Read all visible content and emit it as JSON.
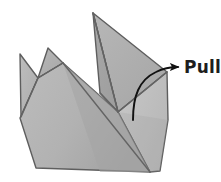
{
  "figure": {
    "name": "origami-pull-step-diagram",
    "type": "instructional-line-drawing",
    "background_color": "#ffffff"
  },
  "annotation": {
    "label": "Pull",
    "label_color": "#1d1d1d",
    "arrow_color": "#111111",
    "arrow_kind": "curved-arrow",
    "arrow_start": [
      133,
      120
    ],
    "arrow_end": [
      180,
      67
    ]
  },
  "palette": {
    "outline": "#5e5e5e",
    "fold_line": "#6b6b6b",
    "face_body_left": "#b9b9b9",
    "face_body_mid": "#a9a9a9",
    "face_body_right": "#c2c2c2",
    "face_flap_left": "#b4b4b4",
    "face_flap_mid": "#adadad",
    "face_spike_tall": "#a6a6a6",
    "face_spike_tall_right": "#b0b0b0",
    "face_shadow": "#9a9a9a"
  },
  "shapes": {
    "body_main": {
      "name": "body-main-face",
      "points": "20,118 37,78 62,63 118,112 150,172 36,168"
    },
    "body_right": {
      "name": "body-right-face",
      "points": "118,112 167,72 168,120 160,170 150,172"
    },
    "spike_left": {
      "name": "left-spike-flap",
      "points": "20,54 37,78 20,118"
    },
    "spike_mid": {
      "name": "middle-spike-flap",
      "points": "48,48 62,63 37,78"
    },
    "spike_tall": {
      "name": "tall-spike-flap",
      "points": "93,13 118,112 101,94"
    },
    "spike_tall_right": {
      "name": "tall-spike-right-face",
      "points": "93,13 167,72 118,112"
    },
    "fold_diagonal": {
      "name": "body-diagonal-fold",
      "points": "62,63 150,172"
    },
    "fold_notch": {
      "name": "spike-notch-fold",
      "points": "101,94 118,112"
    }
  }
}
